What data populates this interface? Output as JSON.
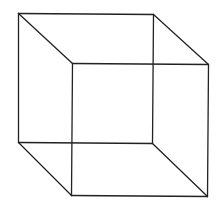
{
  "diagram": {
    "type": "wireframe-cube",
    "stroke_color": "#222222",
    "background": "#ffffff",
    "vertices": {
      "back_top_left": [
        18,
        13
      ],
      "back_top_right": [
        153,
        14
      ],
      "back_bottom_right": [
        152,
        143
      ],
      "back_bottom_left": [
        18,
        142
      ],
      "front_top_left": [
        72,
        63
      ],
      "front_top_right": [
        208,
        64
      ],
      "front_bottom_right": [
        207,
        196
      ],
      "front_bottom_left": [
        71,
        195
      ]
    },
    "edges": [
      [
        "back_top_left",
        "back_top_right"
      ],
      [
        "back_top_right",
        "back_bottom_right"
      ],
      [
        "back_bottom_right",
        "back_bottom_left"
      ],
      [
        "back_bottom_left",
        "back_top_left"
      ],
      [
        "front_top_left",
        "front_top_right"
      ],
      [
        "front_top_right",
        "front_bottom_right"
      ],
      [
        "front_bottom_right",
        "front_bottom_left"
      ],
      [
        "front_bottom_left",
        "front_top_left"
      ],
      [
        "back_top_left",
        "front_top_left"
      ],
      [
        "back_top_right",
        "front_top_right"
      ],
      [
        "back_bottom_right",
        "front_bottom_right"
      ],
      [
        "back_bottom_left",
        "front_bottom_left"
      ]
    ]
  }
}
